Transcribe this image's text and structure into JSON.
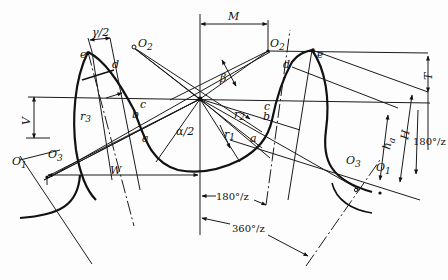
{
  "diagram": {
    "type": "gear-tooth-profile-geometry",
    "background": "#fdfdfd",
    "stroke_color": "#1a1a1a",
    "labels": {
      "M": "M",
      "T": "T",
      "V": "V",
      "W": "W",
      "H": "H",
      "h_a": "h",
      "h_a_sub": "a",
      "gamma_half": "γ/2",
      "beta": "β",
      "alpha_half": "α/2",
      "r1": "r",
      "r1_sub": "1",
      "r2": "r",
      "r2_sub": "2",
      "r3": "r",
      "r3_sub": "3",
      "O1_left": "O",
      "O1_left_sub": "1",
      "O1_right": "O",
      "O1_right_sub": "1",
      "O2_left": "O",
      "O2_left_sub": "2",
      "O2_right": "O",
      "O2_right_sub": "2",
      "O3_left": "O",
      "O3_left_sub": "3",
      "O3_right": "O",
      "O3_right_sub": "3",
      "point_a_left": "a",
      "point_a_right": "a",
      "point_b_left": "b",
      "point_b_right": "b",
      "point_c_left": "c",
      "point_c_right": "c",
      "point_d_left": "d",
      "point_d_right": "d",
      "point_e_left": "e",
      "point_e_right": "e",
      "angle_180_right": "180°/z",
      "angle_180_bottom": "180°/z",
      "angle_360_bottom": "360°/z"
    }
  }
}
